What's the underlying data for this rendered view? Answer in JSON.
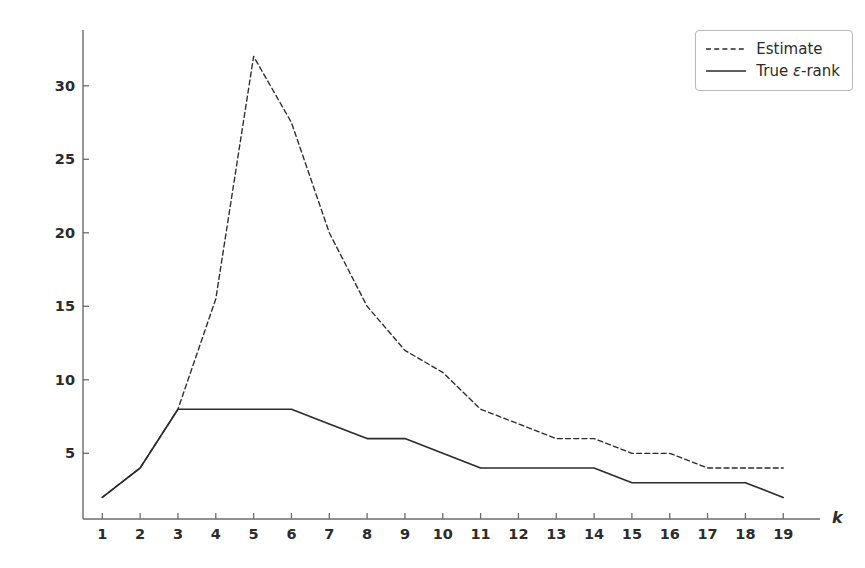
{
  "chart_data": {
    "type": "line",
    "title": "",
    "xlabel": "k",
    "ylabel": "",
    "x": [
      1,
      2,
      3,
      4,
      5,
      6,
      7,
      8,
      9,
      10,
      11,
      12,
      13,
      14,
      15,
      16,
      17,
      18,
      19
    ],
    "xticklabels": [
      "1",
      "2",
      "3",
      "4",
      "5",
      "6",
      "7",
      "8",
      "9",
      "10",
      "11",
      "12",
      "13",
      "14",
      "15",
      "16",
      "17",
      "18",
      "19"
    ],
    "yticks": [
      5,
      10,
      15,
      20,
      25,
      30
    ],
    "yticklabels": [
      "5",
      "10",
      "15",
      "20",
      "25",
      "30"
    ],
    "xlim": [
      0.4,
      20.0
    ],
    "ylim": [
      0.8,
      34.0
    ],
    "grid": false,
    "legend_position": "upper right",
    "series": [
      {
        "name": "Estimate",
        "style": "dashed",
        "color": "#2b2b2b",
        "values": [
          2,
          4,
          8,
          15.5,
          32,
          27.5,
          20,
          15,
          12,
          10.5,
          8,
          7,
          6,
          6,
          5,
          5,
          4,
          4,
          4
        ]
      },
      {
        "name": "True ε-rank",
        "style": "solid",
        "color": "#2b2b2b",
        "values": [
          2,
          4,
          8,
          8,
          8,
          8,
          7,
          6,
          6,
          5,
          4,
          4,
          4,
          4,
          3,
          3,
          3,
          3,
          2
        ]
      }
    ]
  },
  "legend": {
    "entries": [
      {
        "label": "Estimate",
        "style": "dashed"
      },
      {
        "label_prefix": "True ",
        "label_symbol": "ε",
        "label_suffix": "-rank",
        "style": "solid"
      }
    ]
  },
  "axes": {
    "x_axis_label": "k",
    "axis_color": "#6b6b6b",
    "spine_color": "#6b6b6b"
  }
}
